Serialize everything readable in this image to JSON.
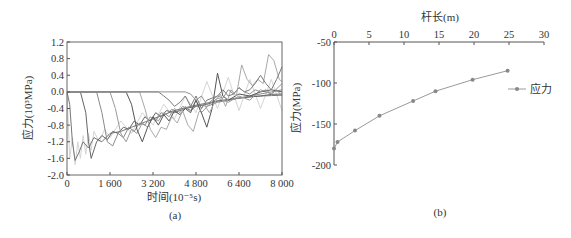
{
  "chart_data": [
    {
      "id": "a",
      "type": "line",
      "panel_label": "(a)",
      "title": "",
      "xlabel": "时间(10⁻⁵s)",
      "ylabel": "应力(10³MPa)",
      "xlim": [
        0,
        8000
      ],
      "ylim": [
        -2.0,
        1.2
      ],
      "xticks": [
        0,
        1600,
        3200,
        4800,
        6400,
        8000
      ],
      "xtick_labels": [
        "0",
        "1 600",
        "3 200",
        "4 800",
        "6 400",
        "8 000"
      ],
      "yticks": [
        1.2,
        0.8,
        0.4,
        0.0,
        -0.4,
        -0.8,
        -1.2,
        -1.6,
        -2.0
      ],
      "ytick_labels": [
        "1.2",
        "0.8",
        "0.4",
        "0.0",
        "-0.4",
        "-0.8",
        "-1.2",
        "-1.6",
        "-2.0"
      ],
      "grid": false,
      "legend": null,
      "series": [
        {
          "name": "oscillating-high-freq",
          "color": "#d4d4d4",
          "x": [
            0,
            100,
            200,
            300,
            400,
            500,
            600,
            700,
            800,
            900,
            1000,
            1200,
            1400,
            1600,
            2000,
            2400,
            2800,
            3200,
            3600,
            4000,
            4400,
            4800,
            5200,
            5600,
            6000,
            6400,
            6800,
            7200,
            7600,
            8000
          ],
          "y": [
            0,
            -1.6,
            -1.1,
            -1.75,
            -1.2,
            -1.6,
            -1.05,
            -1.5,
            -1.0,
            -1.4,
            -0.95,
            -1.2,
            -0.9,
            -1.1,
            -0.7,
            -1.0,
            -0.5,
            -0.8,
            -0.3,
            -0.65,
            -0.1,
            -0.5,
            0.25,
            -0.4,
            0.35,
            -0.45,
            0.3,
            -0.4,
            0.3,
            -0.45
          ]
        },
        {
          "name": "curve-1",
          "color": "#777777",
          "x": [
            0,
            100,
            200,
            300,
            450,
            600,
            800,
            1000,
            1300,
            1600,
            2000,
            2400,
            2800,
            3200,
            3600,
            4000,
            4400,
            4800,
            5200,
            5600,
            6000,
            6400,
            6800,
            7200,
            7600,
            8000
          ],
          "y": [
            0,
            -0.3,
            -1.2,
            -1.65,
            -1.45,
            -1.2,
            -1.35,
            -1.1,
            -1.2,
            -1.0,
            -0.95,
            -0.85,
            -0.75,
            -0.65,
            -0.55,
            -0.45,
            -0.38,
            -0.32,
            -0.27,
            -0.22,
            -0.18,
            -0.15,
            -0.12,
            -0.1,
            -0.09,
            -0.08
          ]
        },
        {
          "name": "curve-2",
          "color": "#666666",
          "x": [
            0,
            500,
            700,
            800,
            900,
            1100,
            1300,
            1500,
            1700,
            1900,
            2100,
            2300,
            2500,
            2700,
            2900,
            3100,
            3300,
            3500,
            3700,
            4000,
            4400,
            4800,
            5200,
            5600,
            6000,
            6400,
            6800,
            7200,
            7600,
            8000
          ],
          "y": [
            0,
            0,
            -0.5,
            -1.2,
            -1.6,
            -1.2,
            -1.05,
            -1.15,
            -0.95,
            -1.0,
            -0.85,
            -0.9,
            -0.7,
            -0.8,
            -0.6,
            -0.7,
            -0.5,
            -0.6,
            -0.45,
            -0.5,
            -0.4,
            -0.35,
            -0.3,
            -0.22,
            -0.2,
            -0.15,
            -0.12,
            -0.1,
            -0.06,
            -0.05
          ]
        },
        {
          "name": "curve-3",
          "color": "#8a8a8a",
          "x": [
            0,
            1100,
            1300,
            1500,
            1700,
            1900,
            2100,
            2300,
            2500,
            2700,
            2900,
            3100,
            3300,
            3500,
            3700,
            3900,
            4100,
            4300,
            4600,
            4900,
            5200,
            5600,
            6000,
            6400,
            6800,
            7200,
            7600,
            8000
          ],
          "y": [
            0,
            0,
            -0.5,
            -1.2,
            -1.3,
            -1.0,
            -1.1,
            -0.85,
            -0.95,
            -0.75,
            -0.8,
            -0.6,
            -0.7,
            -0.5,
            -0.55,
            -0.42,
            -0.5,
            -0.35,
            -0.45,
            -0.3,
            -0.35,
            -0.25,
            -0.2,
            -0.15,
            -0.1,
            -0.05,
            0.0,
            0.05
          ]
        },
        {
          "name": "curve-4",
          "color": "#9a9a9a",
          "x": [
            0,
            1600,
            1800,
            2000,
            2200,
            2400,
            2600,
            2800,
            3000,
            3200,
            3400,
            3600,
            3800,
            4000,
            4200,
            4400,
            4600,
            4800,
            5000,
            5300,
            5600,
            6000,
            6400,
            6800,
            7200,
            7600,
            8000
          ],
          "y": [
            0,
            0,
            -0.4,
            -1.0,
            -1.2,
            -0.9,
            -1.0,
            -0.75,
            -0.85,
            -0.6,
            -0.7,
            -0.5,
            -0.6,
            -0.4,
            -0.5,
            -0.35,
            -0.45,
            -0.2,
            -0.5,
            -0.3,
            -0.15,
            -0.25,
            -0.1,
            -0.2,
            0.05,
            -0.05,
            0.2
          ]
        },
        {
          "name": "curve-5",
          "color": "#555555",
          "x": [
            0,
            2200,
            2400,
            2600,
            2800,
            3000,
            3200,
            3400,
            3600,
            3800,
            4000,
            4200,
            4400,
            4600,
            4800,
            5000,
            5200,
            5400,
            5600,
            5800,
            6000,
            6400,
            6800,
            7200,
            7600,
            8000
          ],
          "y": [
            0,
            0,
            -0.3,
            -0.9,
            -1.2,
            -0.85,
            -0.6,
            -0.8,
            -0.55,
            -0.7,
            -0.45,
            -0.55,
            -0.4,
            -0.5,
            -0.2,
            -0.5,
            -0.85,
            -0.4,
            0.45,
            -0.1,
            -0.2,
            -0.05,
            -0.1,
            0.0,
            0.05,
            0.0
          ]
        },
        {
          "name": "curve-6",
          "color": "#a8a8a8",
          "x": [
            0,
            2700,
            2900,
            3100,
            3300,
            3500,
            3700,
            3900,
            4100,
            4300,
            4500,
            4700,
            4900,
            5100,
            5300,
            5500,
            5700,
            5900,
            6100,
            6300,
            6500,
            6700,
            6900,
            7100,
            7300,
            7500,
            7700,
            7900,
            8000
          ],
          "y": [
            0,
            0,
            -0.4,
            -0.9,
            -1.1,
            -0.85,
            -0.9,
            -0.6,
            -0.75,
            -0.45,
            -0.8,
            -0.95,
            -0.5,
            -0.3,
            -0.5,
            -0.25,
            -0.05,
            -0.35,
            0.05,
            -0.1,
            0.65,
            0.3,
            0.15,
            0.3,
            0.2,
            0.9,
            0.75,
            0.3,
            0.25
          ]
        },
        {
          "name": "curve-7",
          "color": "#7a7a7a",
          "x": [
            0,
            3400,
            3600,
            3800,
            4000,
            4200,
            4400,
            4600,
            4800,
            5000,
            5200,
            5400,
            5600,
            5800,
            6000,
            6200,
            6400,
            6600,
            6800,
            7000,
            7200,
            7400,
            7600,
            7800,
            8000
          ],
          "y": [
            0,
            0,
            -0.1,
            -0.2,
            -0.35,
            -0.25,
            -0.1,
            -0.35,
            -0.1,
            -0.4,
            -0.2,
            -0.15,
            -0.1,
            0.05,
            -0.1,
            -0.05,
            0.1,
            0.0,
            0.05,
            0.2,
            0.4,
            0.2,
            0.05,
            0.3,
            0.6
          ]
        },
        {
          "name": "curve-8",
          "color": "#909090",
          "x": [
            0,
            4400,
            4600,
            4800,
            5000,
            5200,
            5400,
            5600,
            5800,
            6000,
            6200,
            6400,
            6600,
            6800,
            7000,
            7200,
            7400,
            7600,
            7800,
            8000
          ],
          "y": [
            0,
            0,
            -0.05,
            -0.2,
            -0.1,
            -0.3,
            -0.2,
            -0.1,
            -0.15,
            0.05,
            -0.05,
            0.1,
            0.0,
            -0.05,
            0.05,
            0.0,
            0.05,
            -0.05,
            0.05,
            -0.1
          ]
        }
      ]
    },
    {
      "id": "b",
      "type": "line",
      "panel_label": "(b)",
      "title": "",
      "xlabel": "杆长(m)",
      "ylabel": "应力(MPa)",
      "xaxis_position": "top",
      "xlim": [
        0,
        30
      ],
      "ylim": [
        -200,
        -50
      ],
      "xticks": [
        0,
        5,
        10,
        15,
        20,
        25,
        30
      ],
      "xtick_labels": [
        "0",
        "5",
        "10",
        "15",
        "20",
        "25",
        "30"
      ],
      "yticks": [
        -50,
        -100,
        -150,
        -200
      ],
      "ytick_labels": [
        "-50",
        "-100",
        "-150",
        "-200"
      ],
      "grid": false,
      "legend": {
        "position": "right",
        "entries": [
          "应力"
        ]
      },
      "series": [
        {
          "name": "应力",
          "color": "#9a9a9a",
          "marker": "dot",
          "x": [
            0,
            0.5,
            3,
            6.5,
            11.3,
            14.5,
            19.8,
            24.8
          ],
          "y": [
            -180,
            -172,
            -158,
            -140,
            -122,
            -110,
            -96,
            -85
          ]
        }
      ]
    }
  ]
}
